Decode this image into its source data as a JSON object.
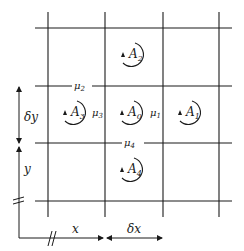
{
  "diagram": {
    "type": "finite-difference-grid",
    "cells": {
      "A0": {
        "base": "A",
        "sub": "0"
      },
      "A1": {
        "base": "A",
        "sub": "1"
      },
      "A2": {
        "base": "A",
        "sub": "2"
      },
      "A3": {
        "base": "A",
        "sub": "3"
      },
      "A4": {
        "base": "A",
        "sub": "4"
      }
    },
    "edges": {
      "mu1": {
        "base": "μ",
        "sub": "1"
      },
      "mu2": {
        "base": "μ",
        "sub": "2"
      },
      "mu3": {
        "base": "μ",
        "sub": "3"
      },
      "mu4": {
        "base": "μ",
        "sub": "4"
      }
    },
    "axes": {
      "x_label": "x",
      "dx_label": "δx",
      "y_label": "y",
      "dy_label": "δy"
    },
    "colors": {
      "line": "#1a1a1a",
      "background": "#ffffff"
    }
  }
}
